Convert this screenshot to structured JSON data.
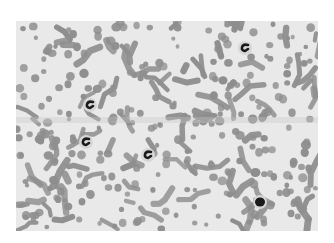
{
  "image": {
    "subject": "microscope blood smear",
    "description": "Grayscale micrograph of a blood smear showing many red blood cells with several dark-stained leukocyte nuclei",
    "colors": {
      "background": "#e9e9e9",
      "rbc": "#8e8e8e",
      "nucleus": "#1a1a1a"
    },
    "features": [
      {
        "name": "leukocyte-nucleus-1",
        "region": "upper-left"
      },
      {
        "name": "leukocyte-nucleus-2",
        "region": "upper-right"
      },
      {
        "name": "leukocyte-nucleus-3",
        "region": "middle-left"
      },
      {
        "name": "leukocyte-nucleus-4",
        "region": "center"
      },
      {
        "name": "leukocyte-nucleus-5",
        "region": "lower-right"
      }
    ]
  }
}
